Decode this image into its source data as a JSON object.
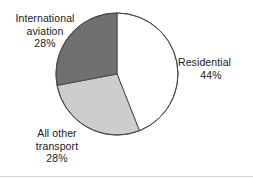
{
  "chart_data": {
    "type": "pie",
    "title": "",
    "subtitle": "",
    "xlabel": "",
    "ylabel": "",
    "legend_position": "none",
    "grid": false,
    "labels_on_slices": false,
    "start_angle_deg": 0,
    "direction": "clockwise",
    "categories": [
      "Residential",
      "All other transport",
      "International aviation"
    ],
    "values": [
      44,
      28,
      28
    ],
    "unit": "%",
    "slices": [
      {
        "name": "Residential",
        "value": 44,
        "value_label": "44%",
        "color": "#ffffff",
        "angle_deg": 158.4,
        "label_position": "right"
      },
      {
        "name": "All other transport",
        "value": 28,
        "value_label": "28%",
        "color": "#cdcdcd",
        "angle_deg": 100.8,
        "label_position": "bottom-left"
      },
      {
        "name": "International aviation",
        "value": 28,
        "value_label": "28%",
        "color": "#707070",
        "angle_deg": 100.8,
        "label_position": "top-left"
      }
    ]
  },
  "labels": {
    "aviation": {
      "line1": "International",
      "line2": "aviation",
      "value": "28%"
    },
    "residential": {
      "line1": "Residential",
      "value": "44%"
    },
    "other_transport": {
      "line1": "All other",
      "line2": "transport",
      "value": "28%"
    }
  },
  "style": {
    "outline_color": "#4a4a4a",
    "background": "#ffffff",
    "text_color": "#1a1a1a",
    "rule_color": "#d2d2d2"
  }
}
